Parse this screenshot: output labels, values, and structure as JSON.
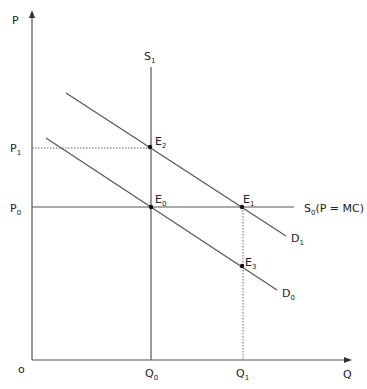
{
  "diagram": {
    "axes": {
      "y_label": "P",
      "x_label": "Q",
      "origin_label": "o"
    },
    "price_labels": {
      "p1": {
        "base": "P",
        "sub": "1"
      },
      "p0": {
        "base": "P",
        "sub": "0"
      }
    },
    "quantity_labels": {
      "q0": {
        "base": "Q",
        "sub": "0"
      },
      "q1": {
        "base": "Q",
        "sub": "1"
      }
    },
    "curves": {
      "s1": {
        "base": "S",
        "sub": "1"
      },
      "s0": {
        "base": "S",
        "sub": "0",
        "suffix": "(P = MC)"
      },
      "d1": {
        "base": "D",
        "sub": "1"
      },
      "d0": {
        "base": "D",
        "sub": "0"
      }
    },
    "points": {
      "e0": {
        "base": "E",
        "sub": "0"
      },
      "e1": {
        "base": "E",
        "sub": "1"
      },
      "e2": {
        "base": "E",
        "sub": "2"
      },
      "e3": {
        "base": "E",
        "sub": "3"
      }
    },
    "colors": {
      "line": "#555555",
      "text": "#222222",
      "dot": "#111111"
    }
  }
}
